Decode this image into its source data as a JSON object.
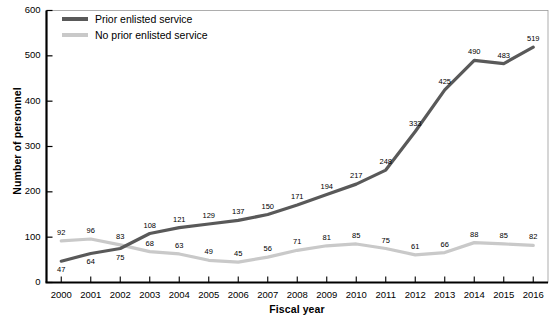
{
  "chart_data": {
    "type": "line",
    "title": "",
    "xlabel": "Fiscal year",
    "ylabel": "Number of personnel",
    "categories": [
      "2000",
      "2001",
      "2002",
      "2003",
      "2004",
      "2005",
      "2006",
      "2007",
      "2008",
      "2009",
      "2010",
      "2011",
      "2012",
      "2013",
      "2014",
      "2015",
      "2016"
    ],
    "x": [
      2000,
      2001,
      2002,
      2003,
      2004,
      2005,
      2006,
      2007,
      2008,
      2009,
      2010,
      2011,
      2012,
      2013,
      2014,
      2015,
      2016
    ],
    "ylim": [
      0,
      600
    ],
    "yticks": [
      0,
      100,
      200,
      300,
      400,
      500,
      600
    ],
    "ytick_labels": [
      "0",
      "100",
      "200",
      "300",
      "400",
      "500",
      "600"
    ],
    "grid": false,
    "legend_position": "top-left",
    "series": [
      {
        "name": "Prior enlisted service",
        "color": "#595959",
        "values": [
          47,
          64,
          75,
          108,
          121,
          129,
          137,
          150,
          171,
          194,
          217,
          248,
          333,
          425,
          490,
          483,
          519
        ],
        "label_side": [
          "below",
          "below",
          "below",
          "above",
          "above",
          "above",
          "above",
          "above",
          "above",
          "above",
          "above",
          "above",
          "above",
          "above",
          "above",
          "above",
          "above"
        ]
      },
      {
        "name": "No prior enlisted service",
        "color": "#c9c9c9",
        "values": [
          92,
          96,
          83,
          68,
          63,
          49,
          45,
          56,
          71,
          81,
          85,
          75,
          61,
          66,
          88,
          85,
          82
        ],
        "label_side": [
          "above",
          "above",
          "above",
          "above",
          "above",
          "above",
          "above",
          "above",
          "above",
          "above",
          "above",
          "above",
          "above",
          "above",
          "above",
          "above",
          "above"
        ]
      }
    ]
  },
  "axis": {
    "y_title": "Number of personnel",
    "x_title": "Fiscal year"
  },
  "legend": {
    "items": [
      {
        "label": "Prior enlisted service",
        "color": "#595959"
      },
      {
        "label": "No prior enlisted service",
        "color": "#c9c9c9"
      }
    ]
  },
  "colors": {
    "prior_enlisted": "#595959",
    "no_prior_enlisted": "#c9c9c9",
    "axis": "#000000",
    "background": "#ffffff"
  }
}
